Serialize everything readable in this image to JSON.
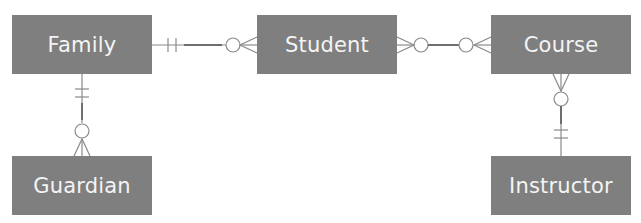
{
  "diagram": {
    "type": "entity-relationship",
    "notation": "crow's foot",
    "entities": [
      {
        "id": "family",
        "label": "Family"
      },
      {
        "id": "student",
        "label": "Student"
      },
      {
        "id": "course",
        "label": "Course"
      },
      {
        "id": "guardian",
        "label": "Guardian"
      },
      {
        "id": "instructor",
        "label": "Instructor"
      }
    ],
    "relationships": [
      {
        "from": "family",
        "to": "student",
        "from_cardinality": "exactly-one",
        "to_cardinality": "zero-or-many"
      },
      {
        "from": "student",
        "to": "course",
        "from_cardinality": "zero-or-many",
        "to_cardinality": "zero-or-many"
      },
      {
        "from": "family",
        "to": "guardian",
        "from_cardinality": "exactly-one",
        "to_cardinality": "zero-or-many"
      },
      {
        "from": "course",
        "to": "instructor",
        "from_cardinality": "zero-or-many",
        "to_cardinality": "exactly-one"
      }
    ],
    "colors": {
      "entity_fill": "#7f7f7f",
      "entity_text": "#f4f4f4",
      "connector": "#8a8a8a"
    }
  }
}
